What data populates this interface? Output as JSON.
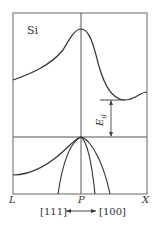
{
  "diagram": {
    "material_label": "Si",
    "gap_label": "E",
    "gap_subscript": "g",
    "x_axis_points": [
      "L",
      "P",
      "X"
    ],
    "direction_left": "[111]",
    "direction_right": "[100]",
    "colors": {
      "line": "#333333",
      "frame": "#555555",
      "background": "#ffffff"
    }
  }
}
